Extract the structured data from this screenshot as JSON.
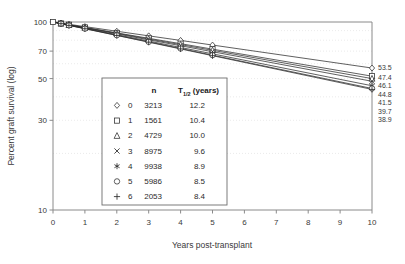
{
  "chart_data": {
    "type": "line",
    "title": "",
    "xlabel": "Years post-transplant",
    "ylabel": "Percent graft survival (log)",
    "yscale": "log",
    "ylim": [
      10,
      100
    ],
    "xlim": [
      0,
      10
    ],
    "grid": true,
    "legend_position": "inside-center",
    "y_ticks": [
      100,
      70,
      50,
      30,
      10
    ],
    "y_tick_labels": [
      "100",
      "70",
      "50",
      "30",
      "10"
    ],
    "x_ticks": [
      0,
      1,
      2,
      3,
      4,
      5,
      6,
      7,
      8,
      9,
      10
    ],
    "x_tick_labels": [
      "0",
      "1",
      "2",
      "3",
      "4",
      "5",
      "6",
      "7",
      "8",
      "9",
      "10"
    ],
    "marker_x_values": [
      0,
      0.25,
      0.5,
      1,
      2,
      3,
      4,
      5,
      10
    ],
    "legend_headers": [
      "",
      "n",
      "T_half_years"
    ],
    "legend_header_labels": [
      "",
      "n",
      "T",
      "1/2",
      " (years)"
    ],
    "series": [
      {
        "name": "0",
        "marker": "diamond",
        "n": "3213",
        "t_half": "12.2",
        "end_label": "53.5",
        "x": [
          0,
          0.25,
          0.5,
          1,
          2,
          3,
          4,
          5,
          10
        ],
        "values": [
          100,
          98.6,
          97.2,
          94.5,
          89.3,
          84.4,
          79.8,
          75.4,
          56.9
        ]
      },
      {
        "name": "1",
        "marker": "square",
        "n": "1561",
        "t_half": "10.4",
        "end_label": "47.4",
        "x": [
          0,
          0.25,
          0.5,
          1,
          2,
          3,
          4,
          5,
          10
        ],
        "values": [
          100,
          98.3,
          96.7,
          93.6,
          87.5,
          81.9,
          76.7,
          71.7,
          51.5
        ]
      },
      {
        "name": "2",
        "marker": "triangle",
        "n": "4729",
        "t_half": "10.0",
        "end_label": "46.1",
        "x": [
          0,
          0.25,
          0.5,
          1,
          2,
          3,
          4,
          5,
          10
        ],
        "values": [
          100,
          98.3,
          96.6,
          93.3,
          87.1,
          81.2,
          75.8,
          70.7,
          50.0
        ]
      },
      {
        "name": "3",
        "marker": "cross",
        "n": "8975",
        "t_half": "9.6",
        "end_label": "44.8",
        "x": [
          0,
          0.25,
          0.5,
          1,
          2,
          3,
          4,
          5,
          10
        ],
        "values": [
          100,
          98.2,
          96.5,
          93.0,
          86.5,
          80.4,
          74.8,
          69.5,
          48.4
        ]
      },
      {
        "name": "4",
        "marker": "asterisk",
        "n": "9938",
        "t_half": "8.9",
        "end_label": "41.5",
        "x": [
          0,
          0.25,
          0.5,
          1,
          2,
          3,
          4,
          5,
          10
        ],
        "values": [
          100,
          98.1,
          96.2,
          92.5,
          85.6,
          79.2,
          73.2,
          67.7,
          45.8
        ]
      },
      {
        "name": "5",
        "marker": "circle",
        "n": "5986",
        "t_half": "8.5",
        "end_label": "39.7",
        "x": [
          0,
          0.25,
          0.5,
          1,
          2,
          3,
          4,
          5,
          10
        ],
        "values": [
          100,
          98.0,
          96.0,
          92.2,
          85.0,
          78.4,
          72.3,
          66.6,
          44.3
        ]
      },
      {
        "name": "6",
        "marker": "plus",
        "n": "2053",
        "t_half": "8.4",
        "end_label": "38.9",
        "x": [
          0,
          0.25,
          0.5,
          1,
          2,
          3,
          4,
          5,
          10
        ],
        "values": [
          100,
          98.0,
          95.9,
          92.1,
          84.8,
          78.1,
          71.9,
          66.2,
          43.8
        ]
      }
    ],
    "end_labels": [
      "53.5",
      "47.4",
      "46.1",
      "44.8",
      "41.5",
      "39.7",
      "38.9"
    ]
  },
  "colors": {
    "line": "#2b2b2b",
    "axis": "#8a8a8a",
    "grid": "#e3e3e3",
    "text": "#3a3a3a",
    "background": "#ffffff"
  }
}
